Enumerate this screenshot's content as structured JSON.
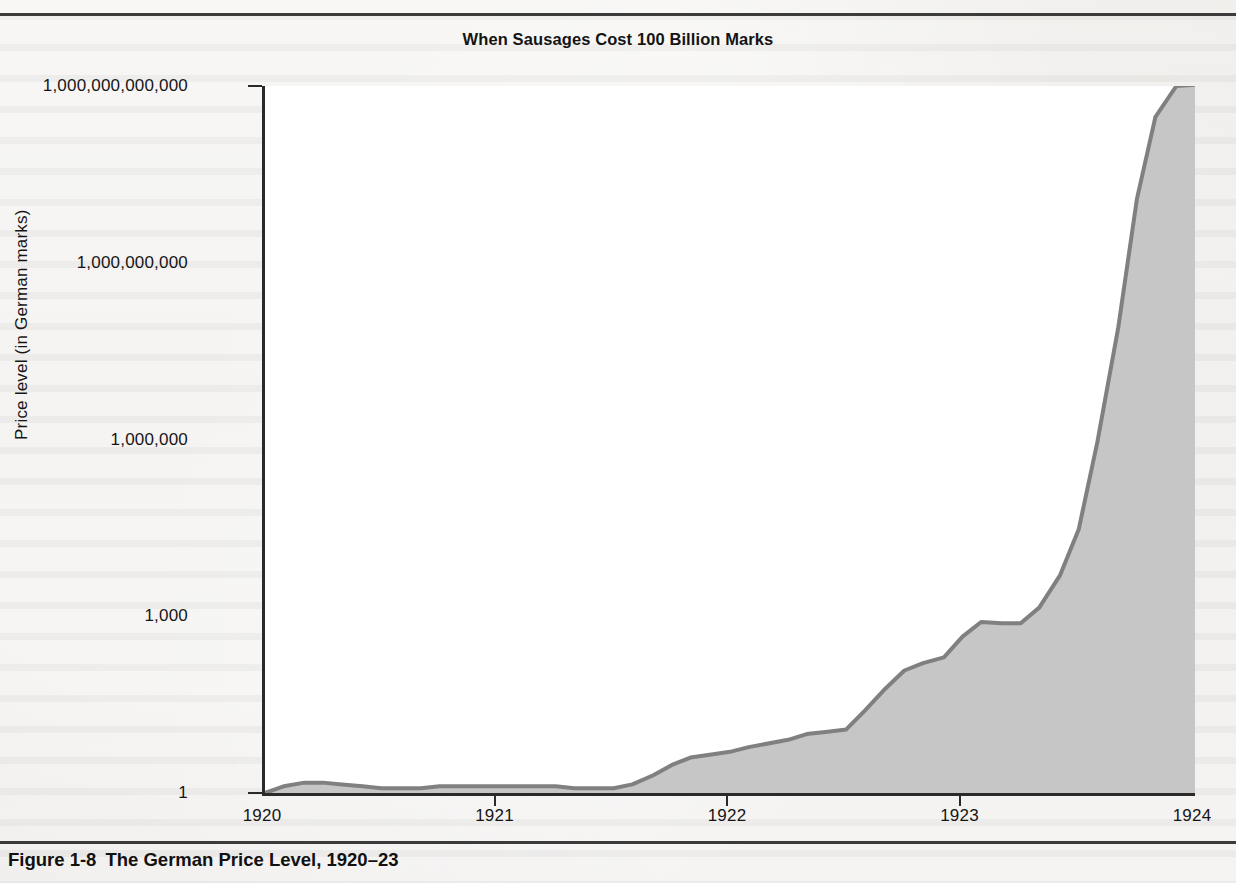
{
  "figure": {
    "title": "When Sausages Cost 100 Billion Marks",
    "caption_number": "Figure 1-8",
    "caption_text": "The German Price Level, 1920–23"
  },
  "colors": {
    "page_background": "#eceae7",
    "plot_background": "#ffffff",
    "area_fill": "#c6c6c6",
    "line": "#808080",
    "axis": "#2a2a2a",
    "text": "#161616",
    "rule": "#3b3b3b"
  },
  "chart_data": {
    "type": "area",
    "title": "When Sausages Cost 100 Billion Marks",
    "xlabel": "",
    "ylabel": "Price level (in German marks)",
    "yscale": "log",
    "ylim": [
      1,
      1000000000000
    ],
    "xlim": [
      1920,
      1924
    ],
    "grid": false,
    "legend": "none",
    "x_tick_labels": [
      "1920",
      "1921",
      "1922",
      "1923",
      "1924"
    ],
    "x_tick_values": [
      1920,
      1921,
      1922,
      1923,
      1924
    ],
    "y_tick_labels": [
      "1",
      "1,000",
      "1,000,000",
      "1,000,000,000",
      "1,000,000,000,000"
    ],
    "y_tick_values": [
      1,
      1000,
      1000000,
      1000000000,
      1000000000000
    ],
    "series": [
      {
        "name": "German price level",
        "x": [
          1920.0,
          1920.08,
          1920.17,
          1920.25,
          1920.33,
          1920.42,
          1920.5,
          1920.58,
          1920.67,
          1920.75,
          1920.83,
          1920.92,
          1921.0,
          1921.08,
          1921.17,
          1921.25,
          1921.33,
          1921.42,
          1921.5,
          1921.58,
          1921.67,
          1921.75,
          1921.83,
          1921.92,
          1922.0,
          1922.08,
          1922.17,
          1922.25,
          1922.33,
          1922.42,
          1922.5,
          1922.58,
          1922.67,
          1922.75,
          1922.83,
          1922.92,
          1923.0,
          1923.08,
          1923.17,
          1923.25,
          1923.33,
          1923.42,
          1923.5,
          1923.58,
          1923.67,
          1923.75,
          1923.83,
          1923.92,
          1924.0
        ],
        "y": [
          1.0,
          1.3,
          1.5,
          1.5,
          1.4,
          1.3,
          1.2,
          1.2,
          1.2,
          1.3,
          1.3,
          1.3,
          1.3,
          1.3,
          1.3,
          1.3,
          1.2,
          1.2,
          1.2,
          1.4,
          2.0,
          3.0,
          4.0,
          4.5,
          5.0,
          6.0,
          7.0,
          8.0,
          10.0,
          11.0,
          12.0,
          25.0,
          60.0,
          120.0,
          160.0,
          200.0,
          450.0,
          800.0,
          760.0,
          760.0,
          1400.0,
          5000.0,
          30000.0,
          900000.0,
          80000000.0,
          12000000000.0,
          300000000000.0,
          1000000000000.0,
          1050000000000.0
        ]
      }
    ]
  },
  "axis_geometry": {
    "plot_left_px": 262,
    "plot_top_px": 86,
    "plot_width_px": 930,
    "plot_height_px": 707
  }
}
